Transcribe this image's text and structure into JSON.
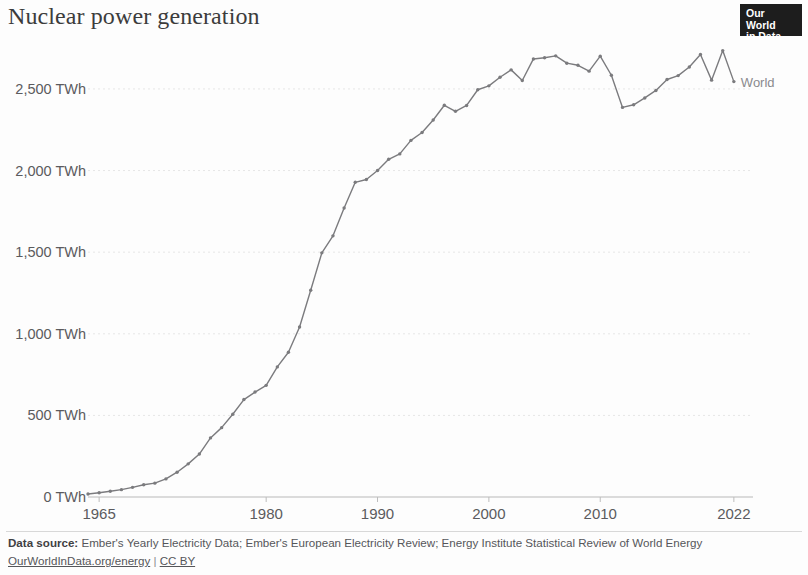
{
  "header": {
    "title": "Nuclear power generation",
    "logo_line1": "Our World",
    "logo_line2": "in Data"
  },
  "footer": {
    "source_label": "Data source:",
    "source_text": "Ember's Yearly Electricity Data; Ember's European Electricity Review; Energy Institute Statistical Review of World Energy",
    "site_link": "OurWorldInData.org/energy",
    "separator": "|",
    "license": "CC BY"
  },
  "chart_data": {
    "type": "line",
    "title": "Nuclear power generation",
    "xlabel": "",
    "ylabel": "",
    "unit": "TWh",
    "grid": true,
    "legend_position": "right-endpoint",
    "xlim": [
      1964,
      2023
    ],
    "ylim": [
      0,
      2800
    ],
    "x_ticks": [
      1965,
      1980,
      1990,
      2000,
      2010,
      2022
    ],
    "x_tick_labels": [
      "1965",
      "1980",
      "1990",
      "2000",
      "2010",
      "2022"
    ],
    "y_ticks": [
      0,
      500,
      1000,
      1500,
      2000,
      2500
    ],
    "y_tick_labels": [
      "0 TWh",
      "500 TWh",
      "1,000 TWh",
      "1,500 TWh",
      "2,000 TWh",
      "2,500 TWh"
    ],
    "series": [
      {
        "name": "World",
        "color": "#7b7b7e",
        "x": [
          1964,
          1965,
          1966,
          1967,
          1968,
          1969,
          1970,
          1971,
          1972,
          1973,
          1974,
          1975,
          1976,
          1977,
          1978,
          1979,
          1980,
          1981,
          1982,
          1983,
          1984,
          1985,
          1986,
          1987,
          1988,
          1989,
          1990,
          1991,
          1992,
          1993,
          1994,
          1995,
          1996,
          1997,
          1998,
          1999,
          2000,
          2001,
          2002,
          2003,
          2004,
          2005,
          2006,
          2007,
          2008,
          2009,
          2010,
          2011,
          2012,
          2013,
          2014,
          2015,
          2016,
          2017,
          2018,
          2019,
          2020,
          2021,
          2022
        ],
        "values": [
          18,
          26,
          35,
          45,
          59,
          75,
          85,
          111,
          152,
          203,
          263,
          362,
          425,
          507,
          597,
          643,
          684,
          797,
          887,
          1042,
          1267,
          1496,
          1600,
          1771,
          1928,
          1945,
          2000,
          2069,
          2102,
          2185,
          2233,
          2310,
          2400,
          2363,
          2399,
          2495,
          2519,
          2572,
          2617,
          2552,
          2684,
          2691,
          2703,
          2658,
          2645,
          2609,
          2701,
          2584,
          2387,
          2403,
          2445,
          2491,
          2558,
          2582,
          2635,
          2711,
          2554,
          2735,
          2545
        ]
      }
    ],
    "annotations": [
      {
        "text": "World",
        "x": 2022,
        "y": 2545
      }
    ]
  }
}
